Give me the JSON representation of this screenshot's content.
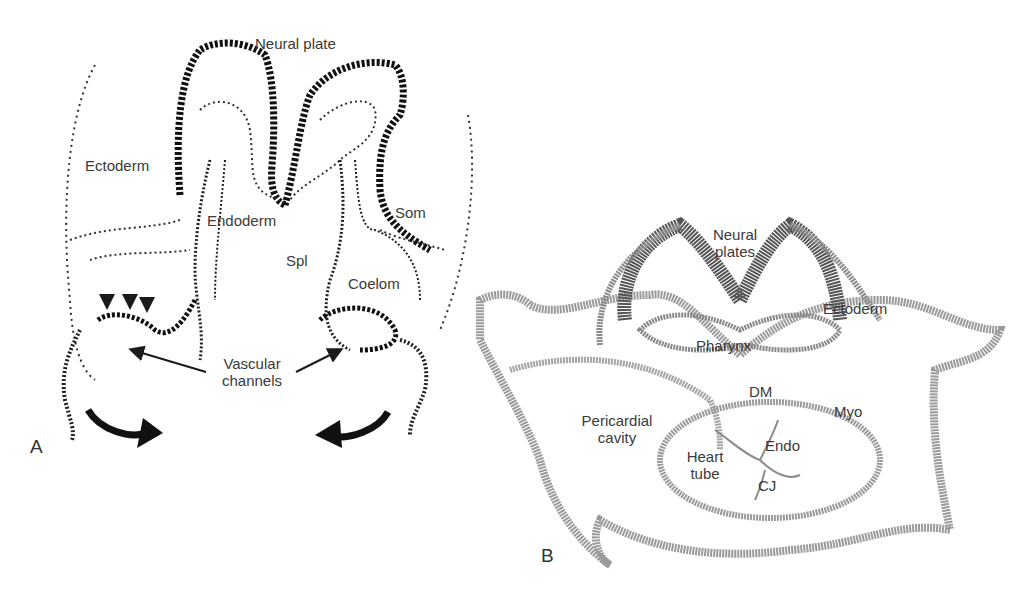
{
  "figure": {
    "panel_a": {
      "letter": "A",
      "labels": {
        "neural_plate": "Neural plate",
        "ectoderm": "Ectoderm",
        "endoderm": "Endoderm",
        "som": "Som",
        "spl": "Spl",
        "coelom": "Coelom",
        "vascular_line1": "Vascular",
        "vascular_line2": "channels"
      }
    },
    "panel_b": {
      "letter": "B",
      "labels": {
        "neural_line1": "Neural",
        "neural_line2": "plates",
        "ectoderm": "Ectoderm",
        "pharynx": "Pharynx",
        "dm": "DM",
        "myo": "Myo",
        "pericardial_line1": "Pericardial",
        "pericardial_line2": "cavity",
        "endo": "Endo",
        "heart_line1": "Heart",
        "heart_line2": "tube",
        "cj": "CJ"
      }
    },
    "colors": {
      "ink": "#1a1a1a",
      "stain_light": "#9a9a9a",
      "stain_dark": "#555555",
      "label": "#3a3a3a"
    }
  }
}
